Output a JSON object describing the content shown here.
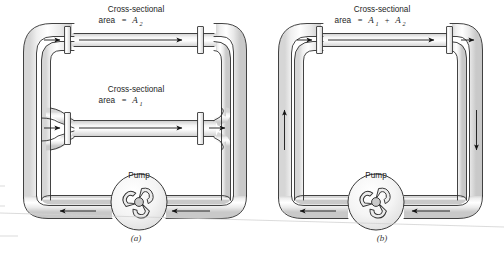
{
  "figure": {
    "type": "physics-diagram",
    "panels": [
      {
        "caption": "(a)",
        "labels": {
          "upper_pipe_line1": "Cross-sectional",
          "upper_pipe_line2_prefix": "area",
          "upper_pipe_line2_eq": "=",
          "upper_pipe_area_symbol": "A",
          "upper_pipe_area_subscript": "2",
          "lower_pipe_line1": "Cross-sectional",
          "lower_pipe_line2_prefix": "area",
          "lower_pipe_line2_eq": "=",
          "lower_pipe_area_symbol": "A",
          "lower_pipe_area_subscript": "1",
          "pump": "Pump"
        }
      },
      {
        "caption": "(b)",
        "labels": {
          "pipe_line1": "Cross-sectional",
          "pipe_line2_prefix": "area",
          "pipe_line2_eq": "=",
          "pipe_area_symbol_1": "A",
          "pipe_area_subscript_1": "1",
          "pipe_area_plus": "+",
          "pipe_area_symbol_2": "A",
          "pipe_area_subscript_2": "2",
          "pump": "Pump"
        }
      }
    ],
    "colors": {
      "outline": "#2b2b2b",
      "pipe_fill": "#f2f2f2",
      "pipe_shade": "#d8d8d8",
      "pipe_highlight": "#ffffff",
      "arrow": "#1a1a1a",
      "background": "#ffffff",
      "page_edge": "#cfcfcf",
      "impeller_hub": "#c9c9c9"
    }
  }
}
